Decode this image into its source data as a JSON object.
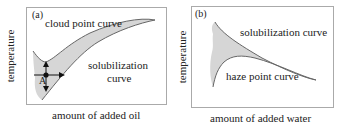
{
  "panels": [
    {
      "id": "a",
      "tag": "(a)",
      "ylabel": "temperature",
      "xlabel": "amount of added oil",
      "curve_labels": [
        "cloud point curve",
        "solubilization",
        "curve"
      ],
      "point_label": "A"
    },
    {
      "id": "b",
      "tag": "(b)",
      "ylabel": "temperature",
      "xlabel": "amount of added water",
      "curve_labels": [
        "solubilization curve",
        "haze point curve"
      ]
    }
  ],
  "colors": {
    "frame": "#aaaaaa",
    "region_fill": "#d6d6d6",
    "curve": "#666666",
    "text": "#222222"
  }
}
